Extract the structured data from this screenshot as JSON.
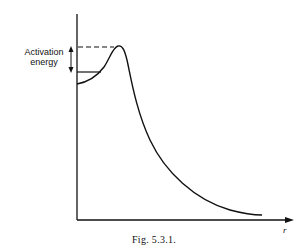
{
  "figure": {
    "caption": "Fig. 5.3.1.",
    "y_annotation_line1": "Activation",
    "y_annotation_line2": "energy",
    "x_axis_label": "r"
  },
  "diagram": {
    "type": "potential energy curve",
    "elements": [
      "y-axis",
      "x-axis with arrow",
      "energy curve with barrier peak",
      "dashed line at peak level",
      "solid line at initial level",
      "double-headed arrow marking activation energy"
    ]
  }
}
